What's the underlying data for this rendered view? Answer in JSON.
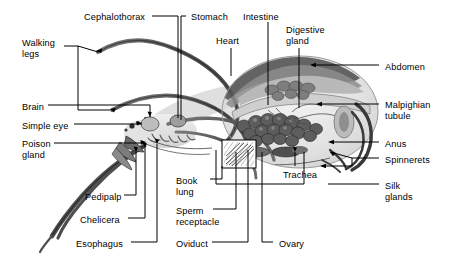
{
  "figure": {
    "background_color": "#ffffff",
    "line_color": "#000000",
    "text_color": "#000000"
  },
  "labels": [
    {
      "id": "cephalothorax",
      "text": "Cephalothorax",
      "x": 84,
      "y": 12,
      "align": "left"
    },
    {
      "id": "stomach",
      "text": "Stomach",
      "x": 191,
      "y": 12,
      "align": "left"
    },
    {
      "id": "intestine",
      "text": "Intestine",
      "x": 243,
      "y": 12,
      "align": "left"
    },
    {
      "id": "digestive-gland",
      "text": "Digestive\ngland",
      "x": 286,
      "y": 25,
      "align": "left"
    },
    {
      "id": "heart",
      "text": "Heart",
      "x": 216,
      "y": 36,
      "align": "left"
    },
    {
      "id": "walking-legs",
      "text": "Walking\nlegs",
      "x": 22,
      "y": 38,
      "align": "left"
    },
    {
      "id": "abdomen",
      "text": "Abdomen",
      "x": 385,
      "y": 62,
      "align": "left"
    },
    {
      "id": "brain",
      "text": "Brain",
      "x": 22,
      "y": 102,
      "align": "left"
    },
    {
      "id": "malpighian-tubule",
      "text": "Malpighian\ntubule",
      "x": 385,
      "y": 100,
      "align": "left"
    },
    {
      "id": "simple-eye",
      "text": "Simple eye",
      "x": 22,
      "y": 121,
      "align": "left"
    },
    {
      "id": "poison-gland",
      "text": "Poison\ngland",
      "x": 22,
      "y": 139,
      "align": "left"
    },
    {
      "id": "anus",
      "text": "Anus",
      "x": 385,
      "y": 139,
      "align": "left"
    },
    {
      "id": "spinnerets",
      "text": "Spinnerets",
      "x": 385,
      "y": 155,
      "align": "left"
    },
    {
      "id": "book-lung",
      "text": "Book\nlung",
      "x": 176,
      "y": 176,
      "align": "left"
    },
    {
      "id": "silk-glands",
      "text": "Silk\nglands",
      "x": 385,
      "y": 181,
      "align": "left"
    },
    {
      "id": "pedipalp",
      "text": "Pedipalp",
      "x": 85,
      "y": 192,
      "align": "left"
    },
    {
      "id": "trachea",
      "text": "Trachea",
      "x": 283,
      "y": 170,
      "align": "left"
    },
    {
      "id": "sperm-receptacle",
      "text": "Sperm\nreceptacle",
      "x": 176,
      "y": 206,
      "align": "left"
    },
    {
      "id": "chelicera",
      "text": "Chelicera",
      "x": 80,
      "y": 215,
      "align": "left"
    },
    {
      "id": "esophagus",
      "text": "Esophagus",
      "x": 76,
      "y": 239,
      "align": "left"
    },
    {
      "id": "oviduct",
      "text": "Oviduct",
      "x": 176,
      "y": 239,
      "align": "left"
    },
    {
      "id": "ovary",
      "text": "Ovary",
      "x": 279,
      "y": 239,
      "align": "left"
    }
  ],
  "leader_lines": [
    {
      "id": "cephalothorax-leader",
      "d": "M152 16 L178 16 L178 118"
    },
    {
      "id": "stomach-leader",
      "d": "M186 16 L181 16 L181 120"
    },
    {
      "id": "intestine-leader",
      "d": "M268 22 L268 105"
    },
    {
      "id": "digestive-gland-leader",
      "d": "M299 48 L299 108"
    },
    {
      "id": "heart-leader",
      "d": "M231 48 L231 76"
    },
    {
      "id": "walking-legs-leader",
      "d": "M64 46 L78 46 L78 110 L110 110"
    },
    {
      "id": "walking-legs-leader2",
      "d": "M78 46 L98 52"
    },
    {
      "id": "abdomen-leader",
      "d": "M379 65 L312 65"
    },
    {
      "id": "brain-leader",
      "d": "M48 105 L150 105 L150 117"
    },
    {
      "id": "malpighian-leader",
      "d": "M379 104 L318 104"
    },
    {
      "id": "simple-eye-leader",
      "d": "M74 124 L142 124"
    },
    {
      "id": "poison-gland-leader",
      "d": "M54 143 L146 143"
    },
    {
      "id": "anus-leader",
      "d": "M379 142 L330 142"
    },
    {
      "id": "spinnerets-leader",
      "d": "M379 158 L352 158 L352 166 L322 166"
    },
    {
      "id": "spinnerets-leader2",
      "d": "M352 158 L330 152"
    },
    {
      "id": "book-lung-leader",
      "d": "M210 179 L222 179 L222 166"
    },
    {
      "id": "silk-glands-leader",
      "d": "M379 184 L328 184"
    },
    {
      "id": "pedipalp-leader",
      "d": "M124 195 L136 195 L136 152"
    },
    {
      "id": "trachea-leader",
      "d": "M295 166 L295 152"
    },
    {
      "id": "trachea-box",
      "d": "M216 184 L216 150 M216 184 L304 184 M304 184 L304 152"
    },
    {
      "id": "sperm-receptacle-leader",
      "d": "M213 209 L236 209 L236 152"
    },
    {
      "id": "chelicera-leader",
      "d": "M128 218 L145 218 L145 148"
    },
    {
      "id": "esophagus-leader",
      "d": "M131 242 L157 242 L157 144"
    },
    {
      "id": "oviduct-leader",
      "d": "M212 242 L248 242 L248 150"
    },
    {
      "id": "ovary-leader",
      "d": "M273 242 L262 242 L262 152"
    }
  ],
  "anatomy_parts": [
    "Cephalothorax",
    "Stomach",
    "Intestine",
    "Digestive gland",
    "Heart",
    "Walking legs",
    "Abdomen",
    "Brain",
    "Malpighian tubule",
    "Simple eye",
    "Poison gland",
    "Anus",
    "Spinnerets",
    "Book lung",
    "Silk glands",
    "Pedipalp",
    "Trachea",
    "Sperm receptacle",
    "Chelicera",
    "Esophagus",
    "Oviduct",
    "Ovary"
  ]
}
